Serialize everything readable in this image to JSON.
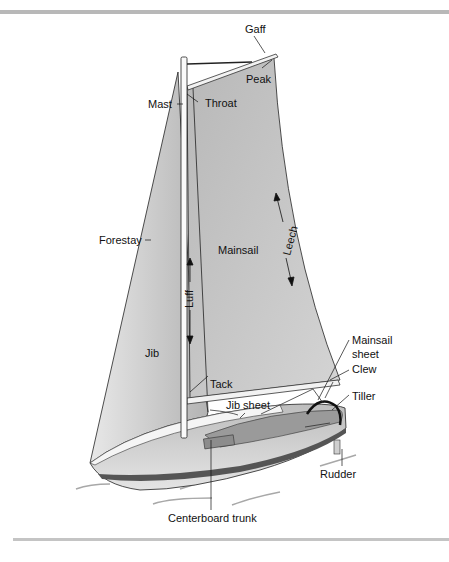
{
  "figure": {
    "labels": {
      "gaff": "Gaff",
      "peak": "Peak",
      "mast": "Mast",
      "throat": "Throat",
      "forestay": "Forestay",
      "mainsail": "Mainsail",
      "leech": "Leech",
      "luff": "Luff",
      "jib": "Jib",
      "tack": "Tack",
      "mainsail_sheet_line1": "Mainsail",
      "mainsail_sheet_line2": "sheet",
      "clew": "Clew",
      "jib_sheet": "Jib sheet",
      "tiller": "Tiller",
      "rudder": "Rudder",
      "centerboard_trunk": "Centerboard trunk"
    },
    "colors": {
      "sail": "#c9c9c9",
      "sail_dark": "#a9a9a9",
      "hull_light": "#e2e2e2",
      "hull_mid": "#b9b9b9",
      "stripe": "#555555",
      "deck": "#9a9a9a",
      "rule": "#b8b8b8",
      "water": "#a0a0a0"
    }
  }
}
